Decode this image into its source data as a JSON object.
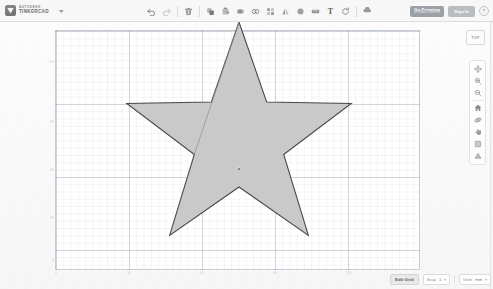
{
  "app": {
    "brand_line1": "AUTODESK",
    "brand_line2": "TINKERCAD",
    "brand_caret": "▾"
  },
  "toolbar": {
    "items": [
      {
        "name": "undo-button",
        "icon": "undo-icon",
        "label": "Undo"
      },
      {
        "name": "redo-button",
        "icon": "redo-icon",
        "label": "Redo"
      },
      {
        "name": "delete-button",
        "icon": "trash-icon",
        "label": "Delete"
      },
      {
        "name": "duplicate-button",
        "icon": "copy-icon",
        "label": "Duplicate"
      },
      {
        "name": "paste-button",
        "icon": "paste-icon",
        "label": "Paste"
      },
      {
        "name": "group-button",
        "icon": "group-icon",
        "label": "Group"
      },
      {
        "name": "ungroup-button",
        "icon": "ungroup-icon",
        "label": "Ungroup"
      },
      {
        "name": "align-button",
        "icon": "align-icon",
        "label": "Align"
      },
      {
        "name": "mirror-button",
        "icon": "mirror-icon",
        "label": "Mirror"
      },
      {
        "name": "shape-button",
        "icon": "shape-icon",
        "label": "Shape"
      },
      {
        "name": "ruler-button",
        "icon": "ruler-icon",
        "label": "Ruler"
      },
      {
        "name": "text-tool-button",
        "icon": "text-icon",
        "label": "T"
      },
      {
        "name": "rotate-button",
        "icon": "rotate-icon",
        "label": "Rotate"
      },
      {
        "name": "import-button",
        "icon": "import-icon",
        "label": "Import"
      }
    ]
  },
  "account": {
    "premium_line1": "Go Premium",
    "premium_line2": "all it takes is one click",
    "signin_label": "Sign In",
    "help_label": "?"
  },
  "viewport": {
    "view_label": "TOP",
    "vertical_ticks": [
      "120",
      "90",
      "60",
      "30",
      "0"
    ],
    "horizontal_ticks": [
      "0",
      "30",
      "60",
      "90",
      "120"
    ]
  },
  "view_tools": {
    "items": [
      {
        "name": "fit-view-button",
        "icon": "fit-all-icon",
        "label": "Fit all in view"
      },
      {
        "name": "zoom-in-button",
        "icon": "zoom-in-icon",
        "label": "Zoom in"
      },
      {
        "name": "zoom-out-button",
        "icon": "zoom-out-icon",
        "label": "Zoom out"
      },
      {
        "name": "home-view-button",
        "icon": "home-view-icon",
        "label": "Home view"
      },
      {
        "name": "orbit-button",
        "icon": "orbit-icon",
        "label": "Orbit"
      },
      {
        "name": "pan-button",
        "icon": "pan-icon",
        "label": "Pan"
      },
      {
        "name": "ortho-toggle-button",
        "icon": "ortho-view-icon",
        "label": "Orthographic"
      },
      {
        "name": "perspective-toggle-button",
        "icon": "perspective-view-icon",
        "label": "Perspective"
      }
    ]
  },
  "statusbar": {
    "edit_grid_label": "Edit Grid",
    "snap_label": "Snap",
    "snap_value": "1",
    "units_label": "Units",
    "units_value": "mm"
  },
  "shape": {
    "name": "star",
    "fill": "#c9c9c9",
    "stroke": "#4a4a4a",
    "points": 5,
    "outer_radius": 118,
    "inner_radius": 47,
    "center_x": 184,
    "center_y": 110,
    "marker_label": "center-handle"
  }
}
